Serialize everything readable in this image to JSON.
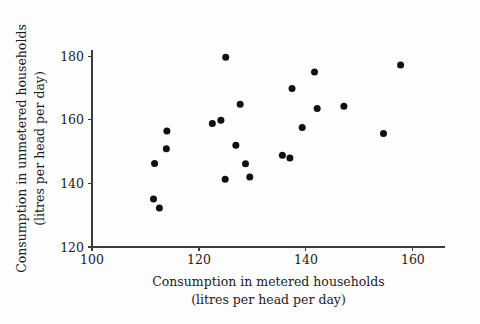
{
  "chart_data": {
    "type": "scatter",
    "title": "",
    "xlabel": "Consumption in metered households (litres per head per day)",
    "xlabel_line1": "Consumption in metered households",
    "xlabel_line2": "(litres per head per day)",
    "ylabel": "Consumption in unmetered households (litres per head per day)",
    "ylabel_line1": "Consumption in unmetered households",
    "ylabel_line2": "(litres per  head  per day)",
    "xlim": [
      100,
      166
    ],
    "ylim": [
      120,
      182
    ],
    "xticks": [
      100,
      120,
      140,
      160
    ],
    "yticks": [
      120,
      140,
      160,
      180
    ],
    "xtick_labels": [
      "100",
      "120",
      "140",
      "160"
    ],
    "ytick_labels": [
      "120",
      "140",
      "160",
      "180"
    ],
    "grid": false,
    "legend": false,
    "marker_color": "#111111",
    "axis_color": "#3c3c3c",
    "background_color": "#fdfdfd",
    "points": [
      {
        "x": 113.9,
        "y": 150.9
      },
      {
        "x": 111.7,
        "y": 146.3
      },
      {
        "x": 114.0,
        "y": 156.5
      },
      {
        "x": 111.5,
        "y": 135.1
      },
      {
        "x": 112.6,
        "y": 132.3
      },
      {
        "x": 125.0,
        "y": 179.7
      },
      {
        "x": 127.7,
        "y": 164.9
      },
      {
        "x": 122.5,
        "y": 158.9
      },
      {
        "x": 124.1,
        "y": 159.9
      },
      {
        "x": 126.9,
        "y": 152.0
      },
      {
        "x": 128.7,
        "y": 146.2
      },
      {
        "x": 124.9,
        "y": 141.3
      },
      {
        "x": 129.5,
        "y": 142.0
      },
      {
        "x": 157.7,
        "y": 177.3
      },
      {
        "x": 141.6,
        "y": 175.1
      },
      {
        "x": 137.4,
        "y": 169.9
      },
      {
        "x": 142.1,
        "y": 163.6
      },
      {
        "x": 147.1,
        "y": 164.3
      },
      {
        "x": 139.3,
        "y": 157.6
      },
      {
        "x": 154.5,
        "y": 155.7
      },
      {
        "x": 135.6,
        "y": 148.9
      },
      {
        "x": 137.0,
        "y": 148.0
      }
    ]
  }
}
